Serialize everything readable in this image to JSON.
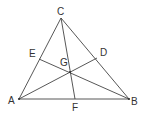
{
  "diagram": {
    "type": "triangle-cevians",
    "stroke_color": "#444444",
    "label_color": "#333333",
    "points": {
      "A": {
        "label": "A",
        "x": 19,
        "y": 99,
        "lx": 8,
        "ly": 104
      },
      "B": {
        "label": "B",
        "x": 129,
        "y": 99,
        "lx": 131,
        "ly": 105
      },
      "C": {
        "label": "C",
        "x": 61,
        "y": 18,
        "lx": 57,
        "ly": 15
      },
      "D": {
        "label": "D",
        "x": 97,
        "y": 58,
        "lx": 100,
        "ly": 56
      },
      "E": {
        "label": "E",
        "x": 39,
        "y": 59,
        "lx": 29,
        "ly": 57
      },
      "F": {
        "label": "F",
        "x": 75,
        "y": 99,
        "lx": 72,
        "ly": 111
      },
      "G": {
        "label": "G",
        "x": 70,
        "y": 72,
        "lx": 60,
        "ly": 66
      }
    },
    "segments": [
      [
        "A",
        "B"
      ],
      [
        "B",
        "C"
      ],
      [
        "C",
        "A"
      ],
      [
        "C",
        "F"
      ],
      [
        "A",
        "D"
      ],
      [
        "B",
        "E"
      ]
    ]
  }
}
